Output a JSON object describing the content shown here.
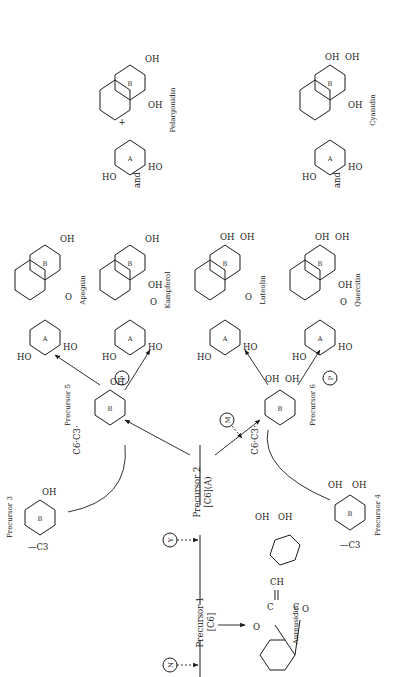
{
  "diagram": {
    "orientation": "rotated 90 degrees counter-clockwise",
    "precursors": [
      {
        "id": "p1",
        "label": "Precursor 1",
        "sub": "[C6]"
      },
      {
        "id": "p2",
        "label": "Precursor 2",
        "sub": "[C6](A)"
      },
      {
        "id": "p3",
        "label": "Precursor 3",
        "group": "—C3",
        "ring": "B",
        "substituent": "OH"
      },
      {
        "id": "p4",
        "label": "Precursor 4",
        "group": "—C3",
        "ring": "B",
        "substituents": [
          "OH",
          "OH"
        ]
      },
      {
        "id": "p5",
        "label": "Precursor 5",
        "group": "C6·C3·",
        "ring": "B",
        "substituent": "OH"
      },
      {
        "id": "p6",
        "label": "Precursor 6",
        "group": "C6·C3·",
        "ring": "B",
        "substituents": [
          "OH",
          "OH"
        ]
      }
    ],
    "genes": [
      {
        "id": "N",
        "label": "N"
      },
      {
        "id": "Y",
        "label": "Y"
      },
      {
        "id": "M",
        "label": "M"
      },
      {
        "id": "P1",
        "label": "P"
      },
      {
        "id": "P2",
        "label": "P"
      }
    ],
    "products": [
      {
        "id": "aureusidin",
        "name": "Aureusidin",
        "atoms": [
          "O",
          "C",
          "C",
          "=CH",
          "O"
        ],
        "substituents": [
          "OH",
          "OH"
        ]
      },
      {
        "id": "apegnin",
        "name": "Apegnin",
        "rings": [
          "A",
          "B"
        ],
        "substituents": [
          "HO",
          "HO",
          "OH"
        ],
        "carbonyl": "O"
      },
      {
        "id": "kampferol",
        "name": "Kampferol",
        "rings": [
          "A",
          "B"
        ],
        "substituents": [
          "HO",
          "HO",
          "OH",
          "OH"
        ],
        "carbonyl": "O"
      },
      {
        "id": "pelargonidin",
        "name": "Pelargonidin",
        "rings": [
          "A",
          "B"
        ],
        "substituents": [
          "HO",
          "HO",
          "OH",
          "OH"
        ],
        "charge": "+"
      },
      {
        "id": "luteolin",
        "name": "Luteolin",
        "rings": [
          "A",
          "B"
        ],
        "substituents": [
          "HO",
          "HO",
          "OH",
          "OH"
        ],
        "carbonyl": "O"
      },
      {
        "id": "quercitin",
        "name": "Quercitin",
        "rings": [
          "A",
          "B"
        ],
        "substituents": [
          "HO",
          "HO",
          "OH",
          "OH",
          "OH"
        ],
        "carbonyl": "O"
      },
      {
        "id": "cyanidin",
        "name": "Cyanidin",
        "rings": [
          "A",
          "B"
        ],
        "substituents": [
          "HO",
          "HO",
          "OH",
          "OH",
          "OH"
        ]
      }
    ],
    "connectors": {
      "and": "and"
    },
    "atom_labels": {
      "O": "O",
      "OH": "OH",
      "HO": "HO",
      "A": "A",
      "B": "B",
      "plus": "+",
      "CH": "CH",
      "C": "C",
      "C3": "C3"
    }
  }
}
